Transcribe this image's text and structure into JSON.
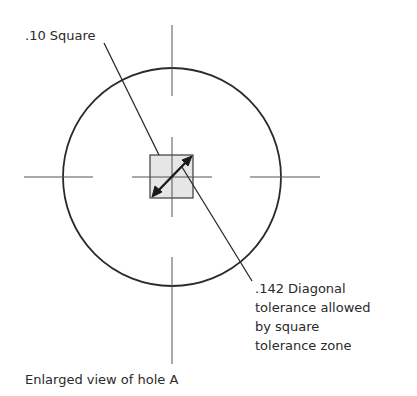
{
  "diagram": {
    "labels": {
      "square": ".10 Square",
      "diagonal": [
        ".142 Diagonal",
        "tolerance allowed",
        "by square",
        "tolerance zone"
      ],
      "caption": "Enlarged view of hole A"
    },
    "geometry": {
      "circle": {
        "cx": 172,
        "cy": 177,
        "r": 109
      },
      "square": {
        "x": 150,
        "y": 155,
        "size": 43,
        "fill": "#e6e6e6"
      },
      "stroke": "#2a2a2a"
    }
  }
}
